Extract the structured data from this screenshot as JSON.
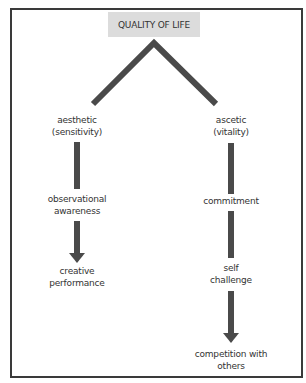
{
  "diagram": {
    "root": {
      "label": "QUALITY OF LIFE"
    },
    "branches": [
      {
        "id": "aesthetic",
        "nodes": [
          {
            "lines": [
              "aesthetic",
              "(sensitivity)"
            ]
          },
          {
            "lines": [
              "observational",
              "awareness"
            ]
          },
          {
            "lines": [
              "creative",
              "performance"
            ]
          }
        ],
        "connectors": [
          "bar",
          "arrow"
        ]
      },
      {
        "id": "ascetic",
        "nodes": [
          {
            "lines": [
              "ascetic",
              "(vitality)"
            ]
          },
          {
            "lines": [
              "commitment"
            ]
          },
          {
            "lines": [
              "self",
              "challenge"
            ]
          },
          {
            "lines": [
              "competition with",
              "others"
            ]
          }
        ],
        "connectors": [
          "bar",
          "bar",
          "arrow"
        ]
      }
    ],
    "colors": {
      "connector": "#4a4a4a",
      "root_fill": "#dcdcdc",
      "frame": "#3a3a3a"
    }
  }
}
